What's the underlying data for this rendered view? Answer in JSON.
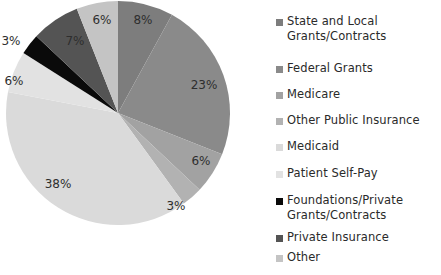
{
  "chart_data": {
    "type": "pie",
    "title": "",
    "start_angle": "12 o'clock",
    "direction": "clockwise",
    "legend_position": "right",
    "categories": [
      "State and Local Grants/Contracts",
      "Federal Grants",
      "Medicare",
      "Other Public Insurance",
      "Medicaid",
      "Patient Self-Pay",
      "Foundations/Private Grants/Contracts",
      "Private Insurance",
      "Other"
    ],
    "values": [
      8,
      23,
      6,
      3,
      38,
      6,
      3,
      7,
      6
    ],
    "labels": [
      "8%",
      "23%",
      "6%",
      "3%",
      "38%",
      "6%",
      "3%",
      "7%",
      "6%"
    ],
    "colors": [
      "#7d7d7d",
      "#8a8a8a",
      "#a2a2a2",
      "#b2b2b2",
      "#dadada",
      "#e2e2e2",
      "#0a0a0a",
      "#545454",
      "#c4c4c4"
    ]
  },
  "legend": {
    "items": [
      {
        "label": "State and Local\nGrants/Contracts",
        "color": "#7d7d7d"
      },
      {
        "label": "Federal Grants",
        "color": "#8a8a8a"
      },
      {
        "label": "Medicare",
        "color": "#a2a2a2"
      },
      {
        "label": "Other Public Insurance",
        "color": "#b2b2b2"
      },
      {
        "label": "Medicaid",
        "color": "#dadada"
      },
      {
        "label": "Patient Self-Pay",
        "color": "#e2e2e2"
      },
      {
        "label": "Foundations/Private\nGrants/Contracts",
        "color": "#0a0a0a"
      },
      {
        "label": "Private Insurance",
        "color": "#545454"
      },
      {
        "label": "Other",
        "color": "#c4c4c4"
      }
    ]
  }
}
